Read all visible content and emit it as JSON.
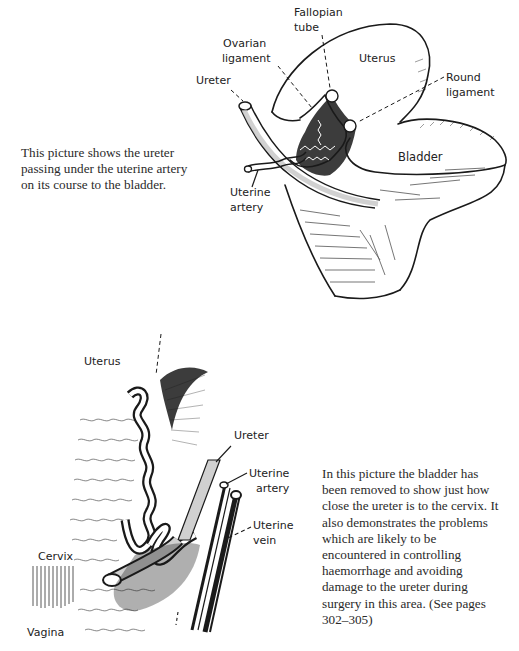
{
  "figure_top": {
    "caption": [
      "This picture shows the ureter",
      "passing under the uterine artery",
      "on its course to the bladder."
    ],
    "labels": {
      "fallopian_tube": [
        "Fallopian",
        "tube"
      ],
      "ovarian_ligament": [
        "Ovarian",
        "ligament"
      ],
      "uterus": "Uterus",
      "ureter": "Ureter",
      "round_ligament": [
        "Round",
        "ligament"
      ],
      "bladder": "Bladder",
      "uterine_artery": [
        "Uterine",
        "artery"
      ]
    }
  },
  "figure_bottom": {
    "caption": [
      "In this picture the bladder has",
      "been removed to show just how",
      "close the ureter is to the cervix. It",
      "also demonstrates the problems",
      "which are likely to be",
      "encountered in controlling",
      "haemorrhage and avoiding",
      "damage to the ureter during",
      "surgery in this area. (See pages",
      "302–305)"
    ],
    "labels": {
      "uterus": "Uterus",
      "ureter": "Ureter",
      "uterine_artery": [
        "Uterine",
        "artery"
      ],
      "uterine_vein": [
        "Uterine",
        "vein"
      ],
      "cervix": "Cervix",
      "vagina": "Vagina"
    }
  },
  "colors": {
    "ink": "#1a1a1a",
    "paper": "#ffffff",
    "shade": "#cfcfcf"
  }
}
